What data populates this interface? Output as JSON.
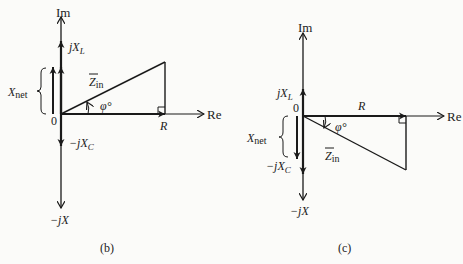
{
  "panels": [
    {
      "id": "b",
      "caption": "(b)",
      "axis_im": "Im",
      "axis_re": "Re",
      "origin": "0",
      "jxl": "jX",
      "jxl_sub": "L",
      "jxc": "−jX",
      "jxc_sub": "C",
      "minus_jx": "−jX",
      "xnet": "X",
      "xnet_sub": "net",
      "zin": "Z",
      "zin_sub": "in",
      "phi": "φ°",
      "r": "R"
    },
    {
      "id": "c",
      "caption": "(c)",
      "axis_im": "Im",
      "axis_re": "Re",
      "origin": "0",
      "jxl": "jX",
      "jxl_sub": "L",
      "jxc": "−jX",
      "jxc_sub": "C",
      "minus_jx": "−jX",
      "xnet": "X",
      "xnet_sub": "net",
      "zin": "Z",
      "zin_sub": "in",
      "phi": "φ°",
      "r": "R"
    }
  ],
  "colors": {
    "line": "#1a1a1a",
    "background": "#fbfbf9"
  }
}
